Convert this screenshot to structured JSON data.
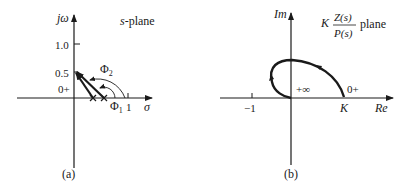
{
  "panel_a": {
    "caption": "(a)",
    "y_axis_label": "jω",
    "x_axis_label": "σ",
    "plane_label": "s-plane",
    "y_ticks": [
      "1.0",
      "0.5",
      "0+"
    ],
    "x_tick": "1",
    "angle_labels": {
      "phi1": "Φ",
      "phi1_sub": "1",
      "phi2": "Φ",
      "phi2_sub": "2"
    },
    "poles": 2
  },
  "panel_b": {
    "caption": "(b)",
    "y_axis_label": "Im",
    "x_axis_label": "Re",
    "plane_label_k": "K",
    "plane_label_num": "Z(s)",
    "plane_label_den": "P(s)",
    "plane_label_suffix": "plane",
    "x_tick": "−1",
    "k_label": "K",
    "start_label": "0+",
    "end_label": "+∞"
  },
  "colors": {
    "ink": "#1a1a1a",
    "background": "#ffffff"
  }
}
